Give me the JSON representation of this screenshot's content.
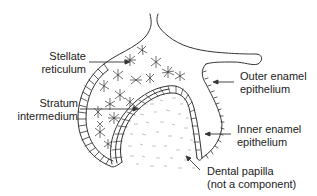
{
  "diagram": {
    "labels": {
      "stellate_reticulum": {
        "line1": "Stellate",
        "line2": "reticulum"
      },
      "stratum_intermedium": {
        "line1": "Stratum",
        "line2": "intermedium"
      },
      "outer_enamel_epithelium": {
        "line1": "Outer enamel",
        "line2": "epithelium"
      },
      "inner_enamel_epithelium": {
        "line1": "Inner enamel",
        "line2": "epithelium"
      },
      "dental_papilla": {
        "line1": "Dental papilla",
        "line2": "(not a component)"
      }
    },
    "colors": {
      "line": "#333333",
      "text": "#222222",
      "background": "#ffffff",
      "papilla_stipple": "#9a9a9a"
    }
  }
}
